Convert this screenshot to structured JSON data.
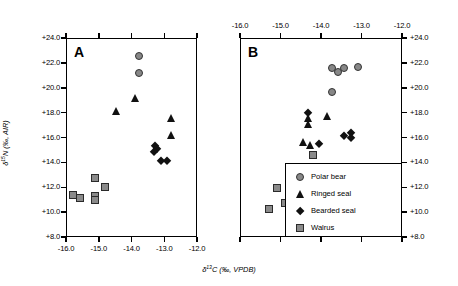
{
  "figure": {
    "panels": [
      {
        "letter": "A"
      },
      {
        "letter": "B"
      }
    ],
    "axes": {
      "x_title_html": "&#948;<sup>13</sup>C (&#8240;, VPDB)",
      "y_title_html": "&#948;<sup>15</sup>N (&#8240;, AIR)",
      "x_ticks": [
        "-16.0",
        "-15.0",
        "-14.0",
        "-13.0",
        "-12.0"
      ],
      "y_ticks": [
        "+24.0",
        "+22.0",
        "+20.0",
        "+18.0",
        "+16.0",
        "+14.0",
        "+12.0",
        "+10.0",
        "+8.0"
      ],
      "xlim": [
        -16.0,
        -12.0
      ],
      "ylim": [
        8.0,
        24.0
      ],
      "x_tick_values": [
        -16.0,
        -15.0,
        -14.0,
        -13.0,
        -12.0
      ],
      "y_tick_values": [
        24.0,
        22.0,
        20.0,
        18.0,
        16.0,
        14.0,
        12.0,
        10.0,
        8.0
      ]
    },
    "legend": {
      "position": "bottom-right-of-panel-B",
      "entries": [
        {
          "label": "Polar bear",
          "marker": "circle",
          "color": "#878787"
        },
        {
          "label": "Ringed seal",
          "marker": "triangle",
          "color": "#111111"
        },
        {
          "label": "Bearded seal",
          "marker": "diamond",
          "color": "#111111"
        },
        {
          "label": "Walrus",
          "marker": "square",
          "color": "#8a8a8a"
        }
      ]
    }
  },
  "chart_data": [
    {
      "type": "scatter",
      "panel": "A",
      "title": "",
      "xlabel": "δ13C (‰, VPDB)",
      "ylabel": "δ15N (‰, AIR)",
      "xlim": [
        -16.0,
        -12.0
      ],
      "ylim": [
        8.0,
        24.0
      ],
      "grid": false,
      "xaxis_position": "bottom",
      "series": [
        {
          "name": "Polar bear",
          "marker": "circle",
          "color": "#878787",
          "points": [
            {
              "x": -13.78,
              "y": 22.55
            },
            {
              "x": -13.78,
              "y": 21.2
            }
          ]
        },
        {
          "name": "Ringed seal",
          "marker": "triangle",
          "color": "#111111",
          "points": [
            {
              "x": -13.88,
              "y": 19.15
            },
            {
              "x": -14.47,
              "y": 18.15
            },
            {
              "x": -12.78,
              "y": 17.55
            },
            {
              "x": -12.8,
              "y": 16.2
            }
          ]
        },
        {
          "name": "Bearded seal",
          "marker": "diamond",
          "color": "#111111",
          "points": [
            {
              "x": -13.27,
              "y": 15.3
            },
            {
              "x": -13.22,
              "y": 15.05
            },
            {
              "x": -13.3,
              "y": 14.85
            },
            {
              "x": -13.1,
              "y": 14.1
            },
            {
              "x": -12.93,
              "y": 14.1
            }
          ]
        },
        {
          "name": "Walrus",
          "marker": "square",
          "color": "#8a8a8a",
          "points": [
            {
              "x": -15.78,
              "y": 11.4
            },
            {
              "x": -15.58,
              "y": 11.1
            },
            {
              "x": -15.1,
              "y": 12.75
            },
            {
              "x": -15.12,
              "y": 11.3
            },
            {
              "x": -15.12,
              "y": 10.95
            },
            {
              "x": -14.8,
              "y": 12.0
            }
          ]
        }
      ]
    },
    {
      "type": "scatter",
      "panel": "B",
      "title": "",
      "xlabel": "δ13C (‰, VPDB)",
      "ylabel": "δ15N (‰, AIR)",
      "xlim": [
        -16.0,
        -12.0
      ],
      "ylim": [
        8.0,
        24.0
      ],
      "grid": false,
      "xaxis_position": "top",
      "series": [
        {
          "name": "Polar bear",
          "marker": "circle",
          "color": "#878787",
          "points": [
            {
              "x": -13.72,
              "y": 21.6
            },
            {
              "x": -13.58,
              "y": 21.25
            },
            {
              "x": -13.44,
              "y": 21.6
            },
            {
              "x": -13.08,
              "y": 21.65
            },
            {
              "x": -13.72,
              "y": 19.65
            }
          ]
        },
        {
          "name": "Ringed seal",
          "marker": "triangle",
          "color": "#111111",
          "points": [
            {
              "x": -14.33,
              "y": 17.55
            },
            {
              "x": -14.33,
              "y": 17.05
            },
            {
              "x": -13.85,
              "y": 17.7
            },
            {
              "x": -14.45,
              "y": 15.65
            },
            {
              "x": -14.28,
              "y": 15.4
            }
          ]
        },
        {
          "name": "Bearded seal",
          "marker": "diamond",
          "color": "#111111",
          "points": [
            {
              "x": -14.33,
              "y": 18.0
            },
            {
              "x": -13.43,
              "y": 16.15
            },
            {
              "x": -13.27,
              "y": 16.35
            },
            {
              "x": -13.25,
              "y": 15.95
            },
            {
              "x": -14.05,
              "y": 15.45
            }
          ]
        },
        {
          "name": "Walrus",
          "marker": "square",
          "color": "#8a8a8a",
          "points": [
            {
              "x": -14.2,
              "y": 14.6
            },
            {
              "x": -15.08,
              "y": 11.9
            },
            {
              "x": -14.88,
              "y": 10.75
            },
            {
              "x": -14.72,
              "y": 11.0
            },
            {
              "x": -14.42,
              "y": 11.9
            },
            {
              "x": -15.28,
              "y": 10.25
            }
          ]
        }
      ]
    }
  ]
}
